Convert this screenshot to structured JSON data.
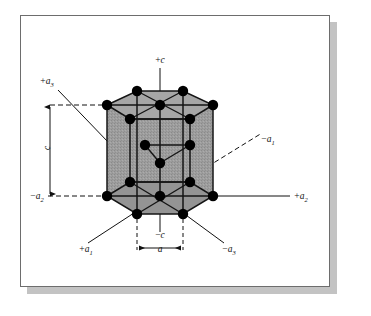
{
  "figure": {
    "kind": "hcp-unit-cell",
    "frame": {
      "border_color": "#6d6d6d",
      "background": "#ffffff",
      "shadow_color": "#b9b9b9"
    },
    "cell": {
      "fill_color": "#9a9a9a",
      "edge_color": "#151515",
      "atom_color": "#000000",
      "atom_radius": 5.2
    },
    "axis_labels": [
      {
        "id": "plus-c",
        "base": "+c",
        "sub": "",
        "x": 160,
        "y": 63,
        "anchor": "middle"
      },
      {
        "id": "plus-a3",
        "base": "+a",
        "sub": "3",
        "x": 47,
        "y": 84,
        "anchor": "middle"
      },
      {
        "id": "minus-a1",
        "base": "−a",
        "sub": "1",
        "x": 268,
        "y": 142,
        "anchor": "middle"
      },
      {
        "id": "plus-a2",
        "base": "+a",
        "sub": "2",
        "x": 301,
        "y": 199,
        "anchor": "middle"
      },
      {
        "id": "minus-a2",
        "base": "−a",
        "sub": "2",
        "x": 37,
        "y": 199,
        "anchor": "middle"
      },
      {
        "id": "plus-a1",
        "base": "+a",
        "sub": "1",
        "x": 86,
        "y": 252,
        "anchor": "middle"
      },
      {
        "id": "minus-a3",
        "base": "−a",
        "sub": "3",
        "x": 229,
        "y": 252,
        "anchor": "middle"
      },
      {
        "id": "minus-c",
        "base": "−c",
        "sub": "",
        "x": 160,
        "y": 238,
        "anchor": "middle"
      }
    ],
    "dimension_labels": [
      {
        "id": "c-dimension",
        "text": "c",
        "x": 50,
        "y": 148,
        "orientation": "vertical"
      },
      {
        "id": "a-dimension",
        "text": "a",
        "x": 160,
        "y": 252,
        "orientation": "horizontal"
      }
    ],
    "geometry": {
      "top_plane_y": 105,
      "bottom_plane_y": 196,
      "mid_plane_y": 150,
      "center_x": 160,
      "hex_left_x": 107,
      "hex_right_x": 213,
      "back_dx": 30,
      "back_dy": -14,
      "front_dx": 30,
      "front_dy": 18
    },
    "atom_counts": {
      "top_layer": 7,
      "middle_layer": 3,
      "bottom_layer": 7,
      "total_drawn": 17
    }
  },
  "chart_data": {
    "type": "diagram",
    "axes": [
      "+c",
      "-c",
      "+a1",
      "-a1",
      "+a2",
      "-a2",
      "+a3",
      "-a3"
    ],
    "lattice_parameters": [
      {
        "symbol": "a",
        "meaning": "basal edge length"
      },
      {
        "symbol": "c",
        "meaning": "cell height"
      }
    ]
  }
}
